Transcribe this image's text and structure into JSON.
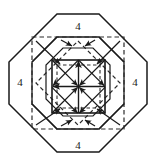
{
  "figure": {
    "type": "geometric-diagram",
    "canvas": {
      "width": 155,
      "height": 163
    },
    "colors": {
      "stroke": "#1a1a1a",
      "background": "#ffffff",
      "dashed": "#2b2b2b"
    },
    "labels": [
      {
        "name": "label-top",
        "text": "4",
        "x": 78,
        "y": 27
      },
      {
        "name": "label-right",
        "text": "4",
        "x": 135,
        "y": 83
      },
      {
        "name": "label-bottom",
        "text": "4",
        "x": 78,
        "y": 146
      },
      {
        "name": "label-left",
        "text": "4",
        "x": 20,
        "y": 83
      }
    ],
    "outer_octagon": {
      "name": "outer-octagon",
      "style": "solid",
      "points": "57,14 100,14 130,44 130,87 100,117 57,117 27,87 27,44"
    },
    "outer_octagon_actual": {
      "points": "57,14 99,14 147,62 147,104 99,152 57,152 9,104 9,62"
    },
    "mid_octagon": {
      "name": "mid-dashed-octagon",
      "style": "dashed",
      "points": "61,37 95,37 119,61 119,95 95,119 61,119 37,95 37,61"
    },
    "inner_square": {
      "name": "inner-solid-square",
      "style": "solid",
      "x": 52,
      "y": 60,
      "width": 53,
      "height": 53
    },
    "inner_dashed_square": {
      "name": "inner-dashed-square",
      "style": "dashed",
      "x": 57,
      "y": 65,
      "width": 43,
      "height": 43
    },
    "grid": {
      "name": "central-grid",
      "rows": 2,
      "cols": 2,
      "cell_diagonals": true,
      "arrowheads": true
    },
    "notes": {
      "side_length": "4",
      "sides": 8,
      "label_count": 4
    }
  }
}
